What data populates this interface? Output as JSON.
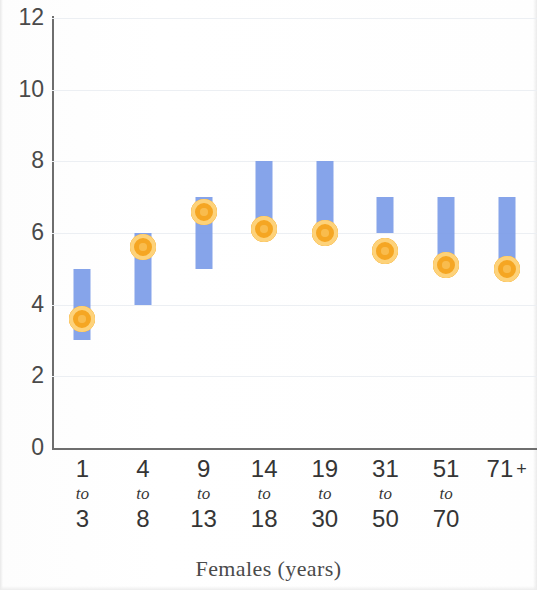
{
  "chart_data": {
    "type": "bar",
    "title": "",
    "subtitle": "",
    "xlabel": "Females (years)",
    "ylabel": "",
    "ylim": [
      0,
      12
    ],
    "ytick_labels": [
      "12",
      "10",
      "8",
      "6",
      "4",
      "2",
      "0"
    ],
    "ytick_values": [
      12,
      10,
      8,
      6,
      4,
      2,
      0
    ],
    "grid": true,
    "legend": "none",
    "categories": [
      "1 to 3",
      "4 to 8",
      "9 to 13",
      "14 to 18",
      "19 to 30",
      "31 to 50",
      "51 to 70",
      "71 +"
    ],
    "category_parts": [
      {
        "lo": "1",
        "mid": "to",
        "hi": "3",
        "plus": false
      },
      {
        "lo": "4",
        "mid": "to",
        "hi": "8",
        "plus": false
      },
      {
        "lo": "9",
        "mid": "to",
        "hi": "13",
        "plus": false
      },
      {
        "lo": "14",
        "mid": "to",
        "hi": "18",
        "plus": false
      },
      {
        "lo": "19",
        "mid": "to",
        "hi": "30",
        "plus": false
      },
      {
        "lo": "31",
        "mid": "to",
        "hi": "50",
        "plus": false
      },
      {
        "lo": "51",
        "mid": "to",
        "hi": "70",
        "plus": false
      },
      {
        "lo": "71",
        "mid": "+",
        "hi": "",
        "plus": true
      }
    ],
    "series": [
      {
        "name": "range-bar",
        "type": "range",
        "color": "#7c9ce8",
        "low": [
          3.0,
          4.0,
          5.0,
          6.0,
          6.0,
          6.0,
          5.0,
          5.0
        ],
        "high": [
          5.0,
          6.0,
          7.0,
          8.0,
          8.0,
          7.0,
          7.0,
          7.0
        ]
      },
      {
        "name": "point-marker",
        "type": "marker",
        "color": "#f5a623",
        "values": [
          3.6,
          5.6,
          6.6,
          6.1,
          6.0,
          5.5,
          5.1,
          5.0
        ]
      }
    ]
  },
  "axis": {
    "x_title": "Females (years)"
  },
  "colors": {
    "bar": "#7c9ce8",
    "marker_ring": "#f5a623",
    "marker_fill": "#fdd27a",
    "axis": "#6e6e6e",
    "grid": "#eceff3",
    "text": "#3a3a3a"
  }
}
